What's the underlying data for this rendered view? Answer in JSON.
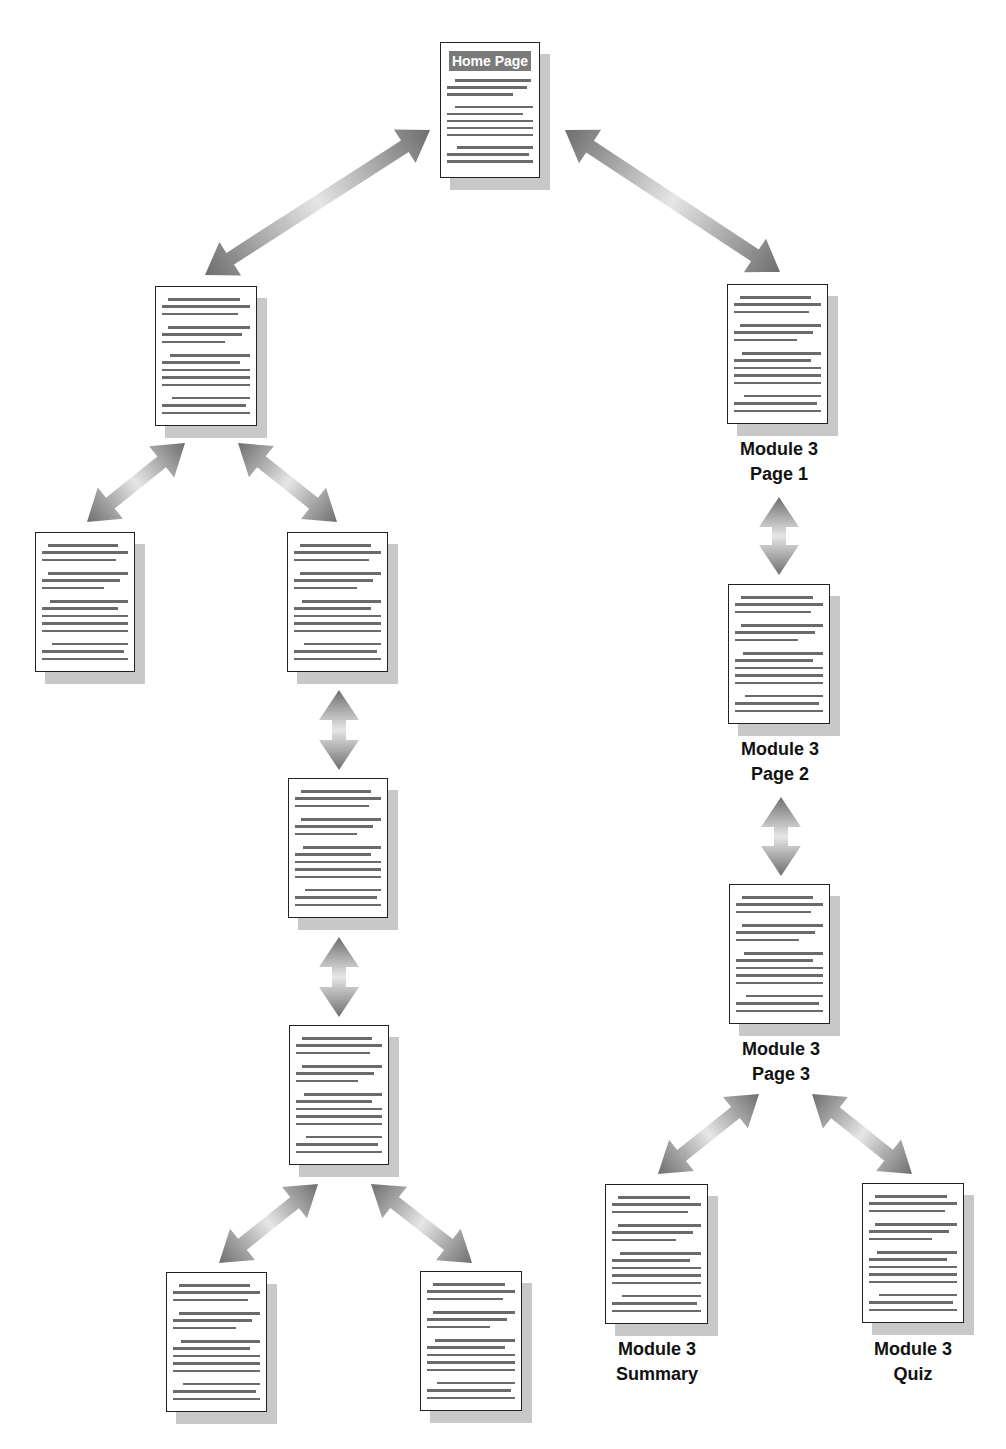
{
  "diagram": {
    "type": "site-navigation-hierarchy",
    "colors": {
      "arrow_dark": "#6e6e6e",
      "arrow_light": "#e6e6e6",
      "page_border": "#222222",
      "page_shadow": "#c8c8c8",
      "text_lines": "#6a6a6a",
      "header_bg": "#7a7a7a"
    },
    "pages": [
      {
        "id": "home",
        "header": "Home Page",
        "label": null,
        "x": 440,
        "y": 42,
        "w": 100,
        "h": 136
      },
      {
        "id": "left-l1",
        "label": null,
        "x": 155,
        "y": 286,
        "w": 102,
        "h": 140
      },
      {
        "id": "left-l2a",
        "label": null,
        "x": 35,
        "y": 532,
        "w": 100,
        "h": 140
      },
      {
        "id": "left-l2b",
        "label": null,
        "x": 287,
        "y": 532,
        "w": 101,
        "h": 140
      },
      {
        "id": "left-l3",
        "label": null,
        "x": 288,
        "y": 778,
        "w": 100,
        "h": 140
      },
      {
        "id": "left-l4",
        "label": null,
        "x": 289,
        "y": 1025,
        "w": 100,
        "h": 140
      },
      {
        "id": "left-l5a",
        "label": null,
        "x": 166,
        "y": 1272,
        "w": 101,
        "h": 140
      },
      {
        "id": "left-l5b",
        "label": null,
        "x": 420,
        "y": 1271,
        "w": 102,
        "h": 140
      },
      {
        "id": "m3p1",
        "label": {
          "line1": "Module 3",
          "line2": "Page 1"
        },
        "x": 727,
        "y": 284,
        "w": 101,
        "h": 140
      },
      {
        "id": "m3p2",
        "label": {
          "line1": "Module 3",
          "line2": "Page 2"
        },
        "x": 728,
        "y": 584,
        "w": 102,
        "h": 140
      },
      {
        "id": "m3p3",
        "label": {
          "line1": "Module 3",
          "line2": "Page 3"
        },
        "x": 729,
        "y": 884,
        "w": 101,
        "h": 140
      },
      {
        "id": "m3summary",
        "label": {
          "line1": "Module 3",
          "line2": "Summary"
        },
        "x": 605,
        "y": 1184,
        "w": 103,
        "h": 140
      },
      {
        "id": "m3quiz",
        "label": {
          "line1": "Module 3",
          "line2": "Quiz"
        },
        "x": 862,
        "y": 1183,
        "w": 102,
        "h": 140
      }
    ],
    "labels": {
      "home": "Home Page",
      "m3p1_l1": "Module 3",
      "m3p1_l2": "Page 1",
      "m3p2_l1": "Module 3",
      "m3p2_l2": "Page 2",
      "m3p3_l1": "Module 3",
      "m3p3_l2": "Page 3",
      "m3summary_l1": "Module 3",
      "m3summary_l2": "Summary",
      "m3quiz_l1": "Module 3",
      "m3quiz_l2": "Quiz"
    },
    "arrows": [
      {
        "from": "home",
        "to": "left-l1",
        "x1": 430,
        "y1": 130,
        "x2": 205,
        "y2": 275
      },
      {
        "from": "home",
        "to": "m3p1",
        "x1": 565,
        "y1": 130,
        "x2": 780,
        "y2": 272
      },
      {
        "from": "left-l1",
        "to": "left-l2a",
        "x1": 185,
        "y1": 443,
        "x2": 87,
        "y2": 522
      },
      {
        "from": "left-l1",
        "to": "left-l2b",
        "x1": 238,
        "y1": 443,
        "x2": 337,
        "y2": 522
      },
      {
        "from": "left-l2b",
        "to": "left-l3",
        "x1": 339,
        "y1": 690,
        "x2": 339,
        "y2": 770
      },
      {
        "from": "left-l3",
        "to": "left-l4",
        "x1": 339,
        "y1": 937,
        "x2": 339,
        "y2": 1017
      },
      {
        "from": "left-l4",
        "to": "left-l5a",
        "x1": 318,
        "y1": 1184,
        "x2": 219,
        "y2": 1263
      },
      {
        "from": "left-l4",
        "to": "left-l5b",
        "x1": 371,
        "y1": 1184,
        "x2": 472,
        "y2": 1263
      },
      {
        "from": "m3p1",
        "to": "m3p2",
        "x1": 779,
        "y1": 497,
        "x2": 779,
        "y2": 575
      },
      {
        "from": "m3p2",
        "to": "m3p3",
        "x1": 781,
        "y1": 797,
        "x2": 781,
        "y2": 876
      },
      {
        "from": "m3p3",
        "to": "m3summary",
        "x1": 759,
        "y1": 1094,
        "x2": 658,
        "y2": 1174
      },
      {
        "from": "m3p3",
        "to": "m3quiz",
        "x1": 812,
        "y1": 1094,
        "x2": 912,
        "y2": 1174
      }
    ],
    "text_line_pattern": [
      {
        "indent": 0.12,
        "end": 0.82
      },
      {
        "indent": 0.06,
        "end": 0.92
      },
      {
        "indent": 0.06,
        "end": 0.8
      },
      {
        "gap": true
      },
      {
        "indent": 0.12,
        "end": 0.92
      },
      {
        "indent": 0.06,
        "end": 0.84
      },
      {
        "indent": 0.06,
        "end": 0.68
      },
      {
        "gap": true
      },
      {
        "indent": 0.14,
        "end": 0.92
      },
      {
        "indent": 0.06,
        "end": 0.82
      },
      {
        "indent": 0.06,
        "end": 0.92
      },
      {
        "indent": 0.06,
        "end": 0.92
      },
      {
        "indent": 0.06,
        "end": 0.92
      },
      {
        "gap": true
      },
      {
        "indent": 0.16,
        "end": 0.92
      },
      {
        "indent": 0.06,
        "end": 0.88
      },
      {
        "indent": 0.06,
        "end": 0.92
      }
    ],
    "home_line_pattern": [
      {
        "indent": 0.14,
        "end": 0.9
      },
      {
        "indent": 0.06,
        "end": 0.86
      },
      {
        "indent": 0.06,
        "end": 0.72
      },
      {
        "gap": true
      },
      {
        "indent": 0.14,
        "end": 0.92
      },
      {
        "indent": 0.06,
        "end": 0.82
      },
      {
        "indent": 0.06,
        "end": 0.92
      },
      {
        "indent": 0.06,
        "end": 0.92
      },
      {
        "indent": 0.06,
        "end": 0.92
      },
      {
        "gap": true
      },
      {
        "indent": 0.16,
        "end": 0.92
      },
      {
        "indent": 0.06,
        "end": 0.88
      },
      {
        "indent": 0.06,
        "end": 0.92
      }
    ]
  }
}
